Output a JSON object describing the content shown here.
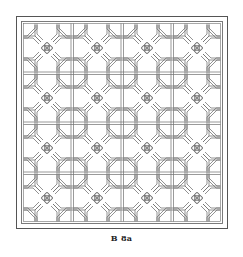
{
  "figure": {
    "caption": "B 8a",
    "colors": {
      "line": "#6e6e6e",
      "fill": "#ffffff",
      "frame": "#555555"
    },
    "grid": {
      "rows": 4,
      "cols": 4,
      "period_px": 50
    }
  }
}
